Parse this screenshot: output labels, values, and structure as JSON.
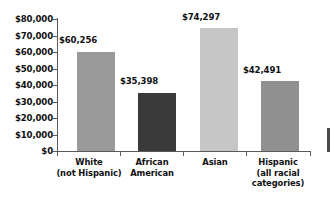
{
  "chart_data": {
    "type": "bar",
    "title": "",
    "subtitle": "",
    "xlabel": "",
    "ylabel": "",
    "grid": false,
    "legend": null,
    "ylim": [
      0,
      80000
    ],
    "y_ticks": [
      "$80,000",
      "$70,000",
      "$60,000",
      "$50,000",
      "$40,000",
      "$30,000",
      "$20,000",
      "$10,000",
      "$0"
    ],
    "y_tick_values": [
      80000,
      70000,
      60000,
      50000,
      40000,
      30000,
      20000,
      10000,
      0
    ],
    "categories": [
      "White (not Hispanic)",
      "African American",
      "Asian",
      "Hispanic (all racial categories)"
    ],
    "category_lines": [
      [
        "White",
        "(not Hispanic)"
      ],
      [
        "African",
        "American"
      ],
      [
        "Asian"
      ],
      [
        "Hispanic",
        "(all racial",
        "categories)"
      ]
    ],
    "values": [
      60256,
      35398,
      74297,
      42491
    ],
    "value_labels": [
      "$60,256",
      "$35,398",
      "$74,297",
      "$42,491"
    ],
    "bar_colors": [
      "#9a9a9a",
      "#3a3a3a",
      "#c6c6c6",
      "#909090"
    ],
    "axis_color": "#5a5a5a",
    "text_color": "#111111"
  }
}
